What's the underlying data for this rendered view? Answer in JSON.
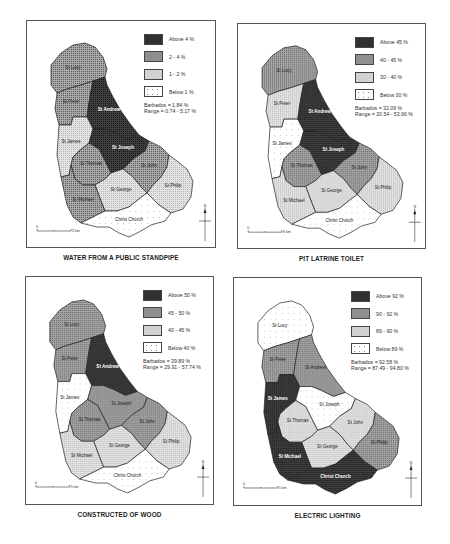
{
  "figure": {
    "panels": [
      {
        "id": "standpipe",
        "title": "WATER FROM A PUBLIC STANDPIPE",
        "legend": [
          {
            "label": "Above 4 %",
            "class": 3
          },
          {
            "label": "2 - 4 %",
            "class": 2
          },
          {
            "label": "1 - 2 %",
            "class": 1
          },
          {
            "label": "Below 1 %",
            "class": 0
          }
        ],
        "barbados": "Barbados = 1.84 %",
        "range": "Range = 0.74 - 5.17 %",
        "parishes": {
          "St Lucy": 2,
          "St Peter": 2,
          "St Andrew": 3,
          "St James": 1,
          "St Joseph": 3,
          "St Thomas": 2,
          "St John": 2,
          "St George": 1,
          "St Michael": 2,
          "St Philip": 1,
          "Christ Church": 0
        }
      },
      {
        "id": "pit-latrine",
        "title": "PIT LATRINE TOILET",
        "legend": [
          {
            "label": "Above 45 %",
            "class": 3
          },
          {
            "label": "40 - 45 %",
            "class": 2
          },
          {
            "label": "30 - 40 %",
            "class": 1
          },
          {
            "label": "Below 30 %",
            "class": 0
          }
        ],
        "barbados": "Barbados = 32.09 %",
        "range": "Range = 20.54 - 53.96 %",
        "parishes": {
          "St Lucy": 2,
          "St Peter": 1,
          "St Andrew": 3,
          "St James": 0,
          "St Joseph": 3,
          "St Thomas": 2,
          "St John": 2,
          "St George": 1,
          "St Michael": 1,
          "St Philip": 1,
          "Christ Church": 0
        }
      },
      {
        "id": "wood",
        "title": "CONSTRUCTED OF WOOD",
        "legend": [
          {
            "label": "Above 50 %",
            "class": 3
          },
          {
            "label": "45 - 50 %",
            "class": 2
          },
          {
            "label": "40 - 45 %",
            "class": 1
          },
          {
            "label": "Below 40 %",
            "class": 0
          }
        ],
        "barbados": "Barbados = 39.89 %",
        "range": "Range = 29.91 - 57.74 %",
        "parishes": {
          "St Lucy": 2,
          "St Peter": 2,
          "St Andrew": 3,
          "St James": 0,
          "St Joseph": 2,
          "St Thomas": 2,
          "St John": 2,
          "St George": 1,
          "St Michael": 1,
          "St Philip": 1,
          "Christ Church": 0
        }
      },
      {
        "id": "electric",
        "title": "ELECTRIC LIGHTING",
        "legend": [
          {
            "label": "Above 92 %",
            "class": 3
          },
          {
            "label": "90 - 92 %",
            "class": 2
          },
          {
            "label": "89 - 90 %",
            "class": 1
          },
          {
            "label": "Below 89 %",
            "class": 0
          }
        ],
        "barbados": "Barbados = 92.58 %",
        "range": "Range = 87.49 - 94.80 %",
        "parishes": {
          "St Lucy": 0,
          "St Peter": 2,
          "St Andrew": 2,
          "St James": 3,
          "St Joseph": 0,
          "St Thomas": 1,
          "St John": 1,
          "St George": 1,
          "St Michael": 3,
          "St Philip": 2,
          "Christ Church": 3
        }
      }
    ],
    "scale_bar": {
      "start": "0",
      "end": "5 km"
    },
    "north_arrow": "N",
    "class_colors": [
      "#fbfbfb",
      "#e4e4e4",
      "#a9a9a9",
      "#3e3e3e"
    ]
  }
}
